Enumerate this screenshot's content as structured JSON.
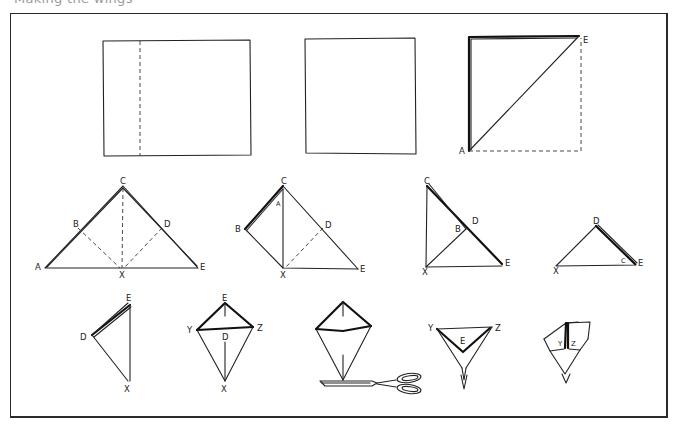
{
  "caption": "Making the wings",
  "steps": [
    {
      "id": 1,
      "shape": "rectangle-with-dashed-fold",
      "labels": []
    },
    {
      "id": 2,
      "shape": "square",
      "labels": []
    },
    {
      "id": 3,
      "shape": "square-diagonal-fold",
      "labels": [
        "A",
        "E"
      ]
    },
    {
      "id": 4,
      "shape": "triangle-with-creases",
      "labels": [
        "A",
        "B",
        "C",
        "D",
        "E",
        "X"
      ]
    },
    {
      "id": 5,
      "shape": "left-flap-folded",
      "labels": [
        "A",
        "B",
        "C",
        "D",
        "E",
        "X"
      ]
    },
    {
      "id": 6,
      "shape": "both-flaps-folded",
      "labels": [
        "B",
        "C",
        "D",
        "E",
        "X"
      ]
    },
    {
      "id": 7,
      "shape": "small-triangle",
      "labels": [
        "C",
        "D",
        "E",
        "X"
      ]
    },
    {
      "id": 8,
      "shape": "cone-side",
      "labels": [
        "D",
        "E",
        "X"
      ]
    },
    {
      "id": 9,
      "shape": "kite-opened",
      "labels": [
        "D",
        "E",
        "X",
        "Y",
        "Z"
      ]
    },
    {
      "id": 10,
      "shape": "kite-with-scissors",
      "labels": []
    },
    {
      "id": 11,
      "shape": "inverted-triangle-tip-cut",
      "labels": [
        "E",
        "Y",
        "Z"
      ]
    },
    {
      "id": 12,
      "shape": "wing-finished",
      "labels": [
        "Y",
        "Z"
      ]
    }
  ],
  "labels": {
    "s3": {
      "A": "A",
      "E": "E"
    },
    "s4": {
      "A": "A",
      "B": "B",
      "C": "C",
      "D": "D",
      "E": "E",
      "X": "X"
    },
    "s5": {
      "A": "A",
      "B": "B",
      "C": "C",
      "D": "D",
      "E": "E",
      "X": "X"
    },
    "s6": {
      "B": "B",
      "C": "C",
      "D": "D",
      "E": "E",
      "X": "X"
    },
    "s7": {
      "C": "C",
      "D": "D",
      "E": "E",
      "X": "X"
    },
    "s8": {
      "D": "D",
      "E": "E",
      "X": "X"
    },
    "s9": {
      "D": "D",
      "E": "E",
      "X": "X",
      "Y": "Y",
      "Z": "Z"
    },
    "s11": {
      "E": "E",
      "Y": "Y",
      "Z": "Z"
    },
    "s12": {
      "Y": "Y",
      "Z": "Z"
    }
  },
  "tools": {
    "scissors": "scissors-icon"
  }
}
